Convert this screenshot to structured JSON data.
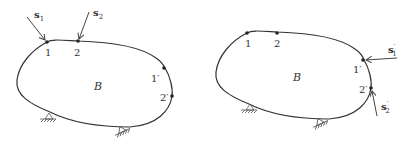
{
  "figure_left": {
    "body_label": "B",
    "points": [
      "1",
      "2",
      "1′",
      "2′"
    ],
    "forces": [
      {
        "name": "s",
        "subscript": "1",
        "prime": ""
      },
      {
        "name": "s",
        "subscript": "2",
        "prime": ""
      }
    ]
  },
  "figure_right": {
    "body_label": "B",
    "points": [
      "1",
      "2",
      "1′",
      "2′"
    ],
    "forces": [
      {
        "name": "s",
        "subscript": "1",
        "prime": "′"
      },
      {
        "name": "s",
        "subscript": "2",
        "prime": "′"
      }
    ]
  },
  "colors": {
    "ink": "#333333",
    "background": "#ffffff"
  }
}
